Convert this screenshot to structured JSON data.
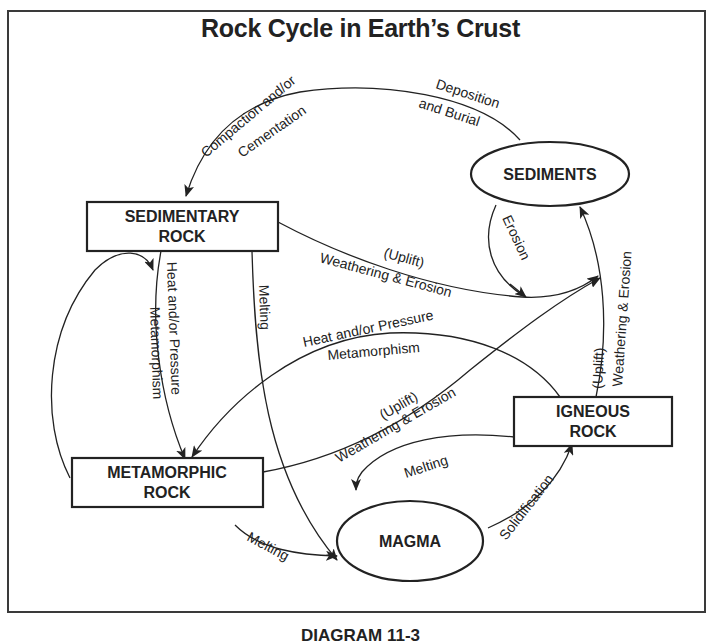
{
  "title": "Rock Cycle in Earth’s Crust",
  "caption": "DIAGRAM 11-3",
  "nodes": {
    "sediments": {
      "label": "SEDIMENTS",
      "shape": "ellipse"
    },
    "sedimentary_rock": {
      "line1": "SEDIMENTARY",
      "line2": "ROCK",
      "shape": "rectangle"
    },
    "metamorphic_rock": {
      "line1": "METAMORPHIC",
      "line2": "ROCK",
      "shape": "rectangle"
    },
    "igneous_rock": {
      "line1": "IGNEOUS",
      "line2": "ROCK",
      "shape": "rectangle"
    },
    "magma": {
      "label": "MAGMA",
      "shape": "ellipse"
    }
  },
  "edges": [
    {
      "from": "sediments",
      "to": "sedimentary_rock",
      "label_1": "Deposition",
      "label_2": "and Burial",
      "label_3": "Compaction and/or",
      "label_4": "Cementation"
    },
    {
      "from": "sediments",
      "to": "weathering_junction",
      "label": "Erosion"
    },
    {
      "from": "sedimentary_rock",
      "to": "sediments",
      "label_1": "(Uplift)",
      "label_2": "Weathering & Erosion"
    },
    {
      "from": "sedimentary_rock",
      "to": "metamorphic_rock",
      "label_1": "Heat and/or Pressure",
      "label_2": "Metamorphism"
    },
    {
      "from": "sedimentary_rock",
      "to": "magma",
      "label": "Melting"
    },
    {
      "from": "metamorphic_rock",
      "to": "sedimentary_rock",
      "label": ""
    },
    {
      "from": "igneous_rock",
      "to": "metamorphic_rock",
      "label_1": "Heat and/or Pressure",
      "label_2": "Metamorphism"
    },
    {
      "from": "metamorphic_rock",
      "to": "sediments",
      "label_1": "(Uplift)",
      "label_2": "Weathering & Erosion"
    },
    {
      "from": "igneous_rock",
      "to": "sediments",
      "label_1": "(Uplift)",
      "label_2": "Weathering & Erosion"
    },
    {
      "from": "metamorphic_rock",
      "to": "magma",
      "label": "Melting"
    },
    {
      "from": "igneous_rock",
      "to": "magma",
      "label": "Melting"
    },
    {
      "from": "magma",
      "to": "igneous_rock",
      "label": "Solidification"
    }
  ],
  "labels": {
    "deposition": "Deposition",
    "and_burial": "and Burial",
    "compaction": "Compaction and/or",
    "cementation": "Cementation",
    "erosion": "Erosion",
    "uplift": "(Uplift)",
    "weathering_erosion": "Weathering & Erosion",
    "heat_pressure": "Heat and/or Pressure",
    "metamorphism": "Metamorphism",
    "melting": "Melting",
    "solidification": "Solidification"
  }
}
